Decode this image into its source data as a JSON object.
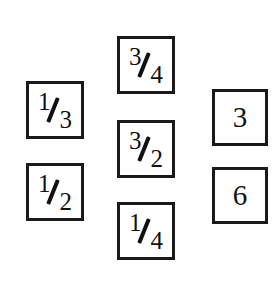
{
  "board": {
    "background_color": "#fefefe",
    "border_color": "#1a1a1a",
    "text_color": "#111111",
    "description": "Seven bordered number cards arranged in three columns"
  },
  "cards": [
    {
      "id": "card-left-top",
      "name": "card-one-third",
      "column": "left",
      "row": 1,
      "kind": "fraction",
      "numerator": "1",
      "denominator": "3",
      "display": "1/3",
      "value": 0.3333,
      "x": 26,
      "y": 81,
      "w": 58,
      "h": 58
    },
    {
      "id": "card-left-bottom",
      "name": "card-one-half",
      "column": "left",
      "row": 2,
      "kind": "fraction",
      "numerator": "1",
      "denominator": "2",
      "display": "1/2",
      "value": 0.5,
      "x": 26,
      "y": 163,
      "w": 58,
      "h": 58
    },
    {
      "id": "card-center-top",
      "name": "card-three-quarters",
      "column": "center",
      "row": 1,
      "kind": "fraction",
      "numerator": "3",
      "denominator": "4",
      "display": "3/4",
      "value": 0.75,
      "x": 117,
      "y": 36,
      "w": 58,
      "h": 58
    },
    {
      "id": "card-center-middle",
      "name": "card-three-halves",
      "column": "center",
      "row": 2,
      "kind": "fraction",
      "numerator": "3",
      "denominator": "2",
      "display": "3/2",
      "value": 1.5,
      "x": 117,
      "y": 120,
      "w": 58,
      "h": 58
    },
    {
      "id": "card-center-bottom",
      "name": "card-one-quarter",
      "column": "center",
      "row": 3,
      "kind": "fraction",
      "numerator": "1",
      "denominator": "4",
      "display": "1/4",
      "value": 0.25,
      "x": 117,
      "y": 202,
      "w": 58,
      "h": 58
    },
    {
      "id": "card-right-top",
      "name": "card-three",
      "column": "right",
      "row": 1,
      "kind": "whole",
      "display": "3",
      "value": 3,
      "x": 212,
      "y": 89,
      "w": 56,
      "h": 57
    },
    {
      "id": "card-right-bottom",
      "name": "card-six",
      "column": "right",
      "row": 2,
      "kind": "whole",
      "display": "6",
      "value": 6,
      "x": 212,
      "y": 167,
      "w": 56,
      "h": 57
    }
  ]
}
